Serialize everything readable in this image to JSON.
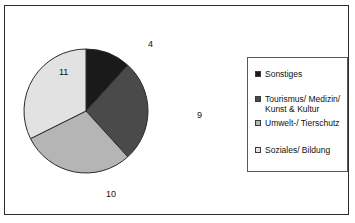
{
  "chart_data": {
    "type": "pie",
    "title": "",
    "categories": [
      "Sonstiges",
      "Tourismus/ Medizin/ Kunst & Kultur",
      "Umwelt-/ Tierschutz",
      "Soziales/ Bildung"
    ],
    "values": [
      4,
      9,
      10,
      11
    ],
    "total": 34,
    "labels": [
      "4",
      "9",
      "10",
      "11"
    ],
    "colors": [
      "#1a1a1a",
      "#4a4a4a",
      "#b5b5b5",
      "#e2e2e2"
    ],
    "slice_border_color": "#2b2b2b",
    "start_angle_deg": 0,
    "direction": "clockwise",
    "legend_position": "right",
    "grid": false,
    "xlabel": "",
    "ylabel": ""
  },
  "legend": {
    "items": [
      {
        "label": "Sonstiges",
        "color": "#1a1a1a",
        "value": 4
      },
      {
        "label": "Tourismus/ Medizin/ Kunst & Kultur",
        "color": "#4a4a4a",
        "value": 9
      },
      {
        "label": "Umwelt-/ Tierschutz",
        "color": "#b5b5b5",
        "value": 10
      },
      {
        "label": "Soziales/ Bildung",
        "color": "#e2e2e2",
        "value": 11
      }
    ]
  },
  "frame": {
    "border_color": "#2b2b2b",
    "background_color": "#ffffff"
  }
}
